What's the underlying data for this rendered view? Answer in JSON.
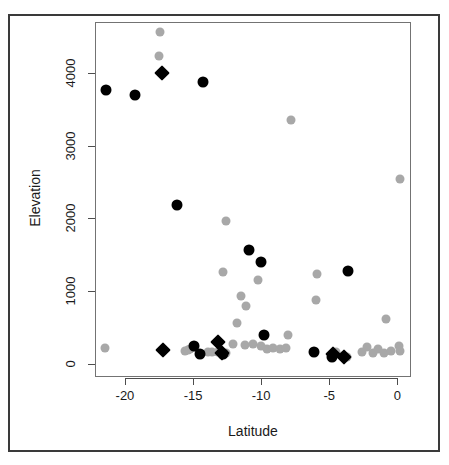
{
  "figure": {
    "background_color": "#ffffff",
    "border_color": "#3a3a3a",
    "panel_border_color": "#737373"
  },
  "chart_data": {
    "type": "scatter",
    "title": "",
    "xlabel": "Latitude",
    "ylabel": "Elevation",
    "xlim": [
      -22.2,
      1.0
    ],
    "ylim": [
      -180,
      4700
    ],
    "xticks": [
      -20,
      -15,
      -10,
      -5,
      0
    ],
    "xticklabels": [
      "-20",
      "-15",
      "-10",
      "-5",
      "0"
    ],
    "yticks": [
      0,
      1000,
      2000,
      3000,
      4000
    ],
    "yticklabels": [
      "0",
      "1000",
      "2000",
      "3000",
      "4000"
    ],
    "grid": false,
    "legend": "none",
    "series": [
      {
        "name": "gray-circles",
        "marker": "circle",
        "color": "#a8a8a8",
        "size": 9,
        "points": [
          [
            -17.4,
            4560
          ],
          [
            -17.5,
            4230
          ],
          [
            -7.8,
            3350
          ],
          [
            0.2,
            2540
          ],
          [
            -12.6,
            1960
          ],
          [
            -12.8,
            1270
          ],
          [
            -10.2,
            1150
          ],
          [
            -5.9,
            1240
          ],
          [
            -11.5,
            930
          ],
          [
            -11.1,
            790
          ],
          [
            -6.0,
            880
          ],
          [
            -0.8,
            620
          ],
          [
            -11.8,
            560
          ],
          [
            -8.0,
            400
          ],
          [
            -21.5,
            220
          ],
          [
            -15.6,
            180
          ],
          [
            -15.4,
            190
          ],
          [
            -15.2,
            210
          ],
          [
            -14.9,
            230
          ],
          [
            -13.9,
            160
          ],
          [
            -13.6,
            160
          ],
          [
            -13.2,
            160
          ],
          [
            -12.9,
            145
          ],
          [
            -12.6,
            145
          ],
          [
            -12.1,
            280
          ],
          [
            -11.2,
            260
          ],
          [
            -10.6,
            270
          ],
          [
            -10.0,
            250
          ],
          [
            -9.6,
            200
          ],
          [
            -9.1,
            215
          ],
          [
            -8.6,
            200
          ],
          [
            -8.2,
            215
          ],
          [
            -4.8,
            120
          ],
          [
            -4.5,
            160
          ],
          [
            -4.0,
            110
          ],
          [
            -3.7,
            100
          ],
          [
            -2.6,
            170
          ],
          [
            -2.2,
            230
          ],
          [
            -1.8,
            145
          ],
          [
            -1.4,
            210
          ],
          [
            -1.0,
            150
          ],
          [
            -0.5,
            175
          ],
          [
            0.1,
            250
          ],
          [
            0.2,
            180
          ]
        ]
      },
      {
        "name": "black-circles",
        "marker": "circle",
        "color": "#000000",
        "size": 11,
        "points": [
          [
            -21.4,
            3760
          ],
          [
            -19.3,
            3690
          ],
          [
            -14.3,
            3880
          ],
          [
            -16.2,
            2180
          ],
          [
            -10.9,
            1560
          ],
          [
            -10.0,
            1400
          ],
          [
            -3.6,
            1280
          ],
          [
            -9.8,
            400
          ],
          [
            -14.9,
            250
          ],
          [
            -14.5,
            130
          ],
          [
            -12.8,
            130
          ],
          [
            -6.1,
            160
          ],
          [
            -4.8,
            90
          ]
        ]
      },
      {
        "name": "black-diamonds",
        "marker": "diamond",
        "color": "#000000",
        "size": 11,
        "points": [
          [
            -17.3,
            4000
          ],
          [
            -17.2,
            190
          ],
          [
            -13.2,
            300
          ],
          [
            -12.9,
            145
          ],
          [
            -4.7,
            130
          ],
          [
            -3.9,
            100
          ]
        ]
      }
    ]
  }
}
